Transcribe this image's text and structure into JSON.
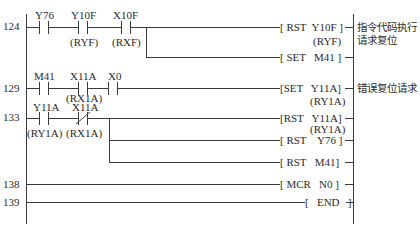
{
  "diagram": {
    "type": "ladder-logic",
    "rungs": [
      {
        "step": "124",
        "contacts": [
          {
            "device": "Y76",
            "alias": "",
            "type": "NO"
          },
          {
            "device": "Y10F",
            "alias": "(RYF)",
            "type": "NO"
          },
          {
            "device": "X10F",
            "alias": "(RXF)",
            "type": "NO"
          }
        ],
        "outputs": [
          {
            "instruction": "[ RST  Y10F ]",
            "alias": "(RYF)"
          },
          {
            "instruction": "[ SET   M41 ]",
            "alias": ""
          }
        ],
        "comment_line1": "指令代码执行",
        "comment_line2": "请求复位"
      },
      {
        "step": "129",
        "contacts": [
          {
            "device": "M41",
            "alias": "",
            "type": "NO"
          },
          {
            "device": "X11A",
            "alias": "(RX1A)",
            "type": "NO"
          },
          {
            "device": "X0",
            "alias": "",
            "type": "NO"
          }
        ],
        "outputs": [
          {
            "instruction": "[SET   Y11A]",
            "alias": "(RY1A)"
          }
        ],
        "comment_line1": "错误复位请求"
      },
      {
        "step": "133",
        "contacts": [
          {
            "device": "Y11A",
            "alias": "(RY1A)",
            "type": "NO"
          },
          {
            "device": "X11A",
            "alias": "(RX1A)",
            "type": "NC"
          }
        ],
        "outputs": [
          {
            "instruction": "[RST   Y11A]",
            "alias": "(RY1A)"
          },
          {
            "instruction": "[ RST    Y76 ]",
            "alias": ""
          },
          {
            "instruction": "[ RST   M41]",
            "alias": ""
          }
        ]
      },
      {
        "step": "138",
        "contacts": [],
        "outputs": [
          {
            "instruction": "[ MCR   N0 ]",
            "alias": ""
          }
        ]
      },
      {
        "step": "139",
        "contacts": [],
        "outputs": [
          {
            "instruction": "[   END   ]",
            "alias": ""
          }
        ]
      }
    ]
  }
}
